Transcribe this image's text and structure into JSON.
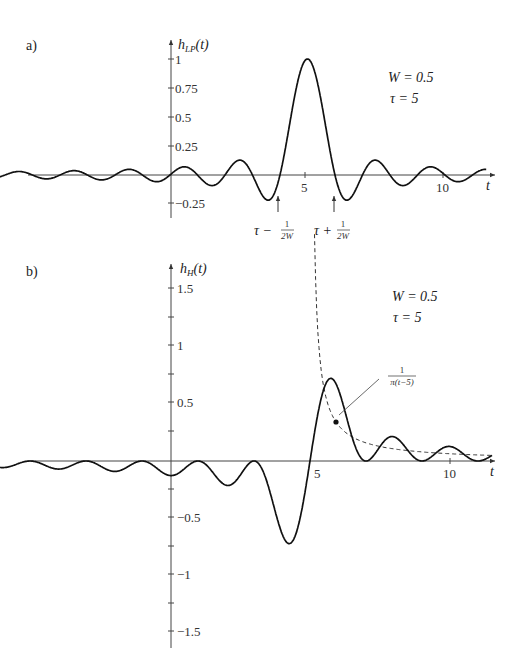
{
  "chart_data": [
    {
      "panel": "a)",
      "type": "line",
      "ylabel": "h_LP(t)",
      "xlabel": "t",
      "function": "sinc lowpass: sin(2πW(t−τ))/(π(t−τ)) normalized to peak 1",
      "params": {
        "W": 0.5,
        "tau": 5
      },
      "annotations": [
        "W = 0.5",
        "τ = 5",
        "τ − 1/(2W)",
        "τ + 1/(2W)"
      ],
      "x_range": [
        -6.5,
        11.5
      ],
      "ylim": [
        -0.3,
        1.1
      ],
      "xticks": [
        5,
        10
      ],
      "yticks": [
        1,
        0.75,
        0.5,
        0.25,
        -0.25
      ],
      "peak": {
        "t": 5,
        "value": 1
      },
      "zero_crossings_marked": [
        4,
        6
      ],
      "grid": false
    },
    {
      "panel": "b)",
      "type": "line",
      "ylabel": "h_H(t)",
      "xlabel": "t",
      "function": "(1 − cos(2πW(t−τ)))/(π(t−τ))",
      "params": {
        "W": 0.5,
        "tau": 5
      },
      "annotations": [
        "W = 0.5",
        "τ = 5",
        "1/π(t−5)"
      ],
      "envelope": "1/(π(t−5)) dashed",
      "x_range": [
        -6.5,
        11.5
      ],
      "ylim": [
        -1.6,
        1.6
      ],
      "xticks": [
        5,
        10
      ],
      "yticks": [
        1.5,
        1,
        0.5,
        -0.5,
        -1,
        -1.5
      ],
      "peaks": [
        {
          "t": 5.74,
          "value": 1.38
        },
        {
          "t": 4.26,
          "value": -1.38
        }
      ],
      "grid": false
    }
  ],
  "panel_a": {
    "label": "a)",
    "ylabel_main": "h",
    "ylabel_sub": "LP",
    "ylabel_arg": "(t)",
    "xlabel": "t",
    "yticks": [
      "1",
      "0.75",
      "0.5",
      "0.25",
      "−0.25"
    ],
    "xticks": [
      "5",
      "10"
    ],
    "param_W": "W = 0.5",
    "param_tau": "τ = 5",
    "marker_left": "τ −",
    "marker_right": "τ +",
    "frac_num": "1",
    "frac_den": "2W"
  },
  "panel_b": {
    "label": "b)",
    "ylabel_main": "h",
    "ylabel_sub": "H",
    "ylabel_arg": "(t)",
    "xlabel": "t",
    "yticks": [
      "1.5",
      "1",
      "0.5",
      "−0.5",
      "−1",
      "−1.5"
    ],
    "xticks": [
      "5",
      "10"
    ],
    "param_W": "W = 0.5",
    "param_tau": "τ = 5",
    "envelope_num": "1",
    "envelope_den": "π(t−5)"
  }
}
